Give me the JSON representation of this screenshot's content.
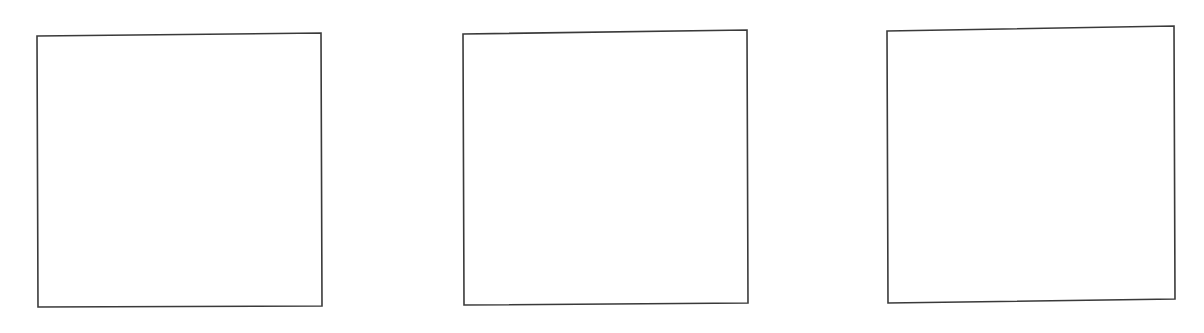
{
  "page": {
    "background_color": "#ffffff",
    "width": 1204,
    "height": 333
  },
  "style": {
    "line_color": "#3a3a3a",
    "fill_color": "#ffffff",
    "stroke_width": 1.6
  },
  "boxes": [
    {
      "id": "box-1",
      "label": "",
      "content": "",
      "state": "empty",
      "corners": {
        "top_left": "37,36",
        "top_right": "321,33",
        "bottom_right": "322,306",
        "bottom_left": "38,307"
      },
      "points": "37,36 321,33 322,306 38,307"
    },
    {
      "id": "box-2",
      "label": "",
      "content": "",
      "state": "empty",
      "corners": {
        "top_left": "463,34",
        "top_right": "747,30",
        "bottom_right": "748,303",
        "bottom_left": "464,305"
      },
      "points": "463,34 747,30 748,303 464,305"
    },
    {
      "id": "box-3",
      "label": "",
      "content": "",
      "state": "empty",
      "corners": {
        "top_left": "887,31",
        "top_right": "1174,26",
        "bottom_right": "1175,299",
        "bottom_left": "888,303"
      },
      "points": "887,31 1174,26 1175,299 888,303"
    }
  ]
}
